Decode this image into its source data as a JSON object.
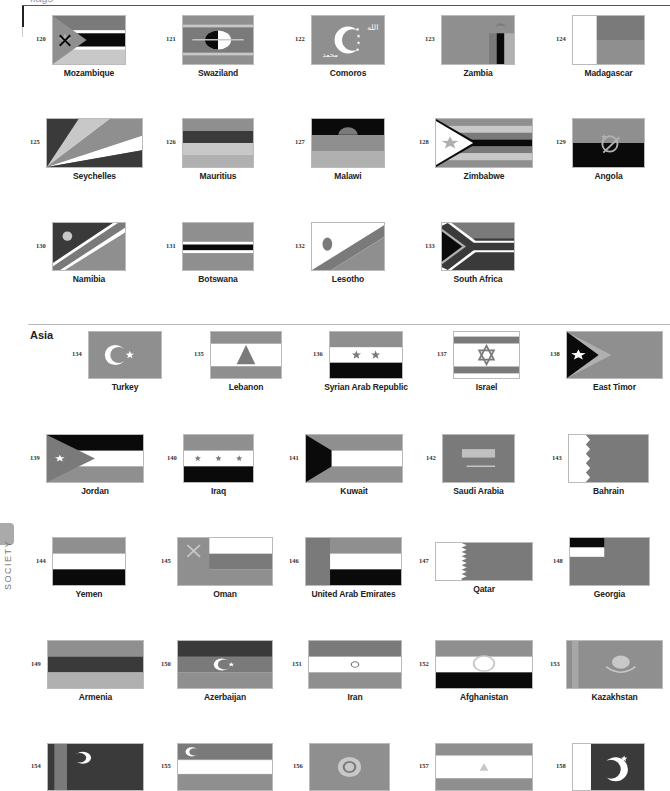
{
  "header": {
    "title": "flags"
  },
  "side_tab": {
    "label": "SOCIETY"
  },
  "sections": [
    {
      "label": "Asia",
      "x": 30,
      "y": 329
    }
  ],
  "colors": {
    "dark": "#3a3a3a",
    "mid": "#7a7a7a",
    "midlight": "#8f8f8f",
    "light": "#b0b0b0",
    "lighter": "#c8c8c8",
    "black": "#0a0a0a",
    "white": "#ffffff"
  },
  "flags": [
    {
      "num": "120",
      "name": "Mozambique",
      "x": 52,
      "y": 15,
      "w": 74,
      "h": 50,
      "kind": "mozambique"
    },
    {
      "num": "121",
      "name": "Swaziland",
      "x": 182,
      "y": 15,
      "w": 72,
      "h": 50,
      "kind": "swaziland"
    },
    {
      "num": "122",
      "name": "Comoros",
      "x": 311,
      "y": 15,
      "w": 74,
      "h": 50,
      "kind": "comoros"
    },
    {
      "num": "123",
      "name": "Zambia",
      "x": 441,
      "y": 15,
      "w": 74,
      "h": 50,
      "kind": "zambia"
    },
    {
      "num": "124",
      "name": "Madagascar",
      "x": 572,
      "y": 15,
      "w": 73,
      "h": 50,
      "kind": "madagascar"
    },
    {
      "num": "125",
      "name": "Seychelles",
      "x": 46,
      "y": 118,
      "w": 97,
      "h": 50,
      "kind": "seychelles"
    },
    {
      "num": "126",
      "name": "Mauritius",
      "x": 182,
      "y": 118,
      "w": 72,
      "h": 50,
      "kind": "mauritius"
    },
    {
      "num": "127",
      "name": "Malawi",
      "x": 311,
      "y": 118,
      "w": 74,
      "h": 50,
      "kind": "malawi"
    },
    {
      "num": "128",
      "name": "Zimbabwe",
      "x": 435,
      "y": 118,
      "w": 98,
      "h": 50,
      "kind": "zimbabwe"
    },
    {
      "num": "129",
      "name": "Angola",
      "x": 572,
      "y": 118,
      "w": 73,
      "h": 50,
      "kind": "angola"
    },
    {
      "num": "130",
      "name": "Namibia",
      "x": 52,
      "y": 222,
      "w": 74,
      "h": 49,
      "kind": "namibia"
    },
    {
      "num": "131",
      "name": "Botswana",
      "x": 182,
      "y": 222,
      "w": 72,
      "h": 49,
      "kind": "botswana"
    },
    {
      "num": "132",
      "name": "Lesotho",
      "x": 311,
      "y": 222,
      "w": 74,
      "h": 49,
      "kind": "lesotho"
    },
    {
      "num": "133",
      "name": "South Africa",
      "x": 441,
      "y": 222,
      "w": 74,
      "h": 49,
      "kind": "southafrica"
    },
    {
      "num": "134",
      "name": "Turkey",
      "x": 88,
      "y": 331,
      "w": 74,
      "h": 48,
      "kind": "turkey"
    },
    {
      "num": "135",
      "name": "Lebanon",
      "x": 210,
      "y": 331,
      "w": 72,
      "h": 48,
      "kind": "lebanon"
    },
    {
      "num": "136",
      "name": "Syrian Arab Republic",
      "x": 329,
      "y": 331,
      "w": 74,
      "h": 48,
      "kind": "syria"
    },
    {
      "num": "137",
      "name": "Israel",
      "x": 453,
      "y": 331,
      "w": 67,
      "h": 48,
      "kind": "israel"
    },
    {
      "num": "138",
      "name": "East Timor",
      "x": 566,
      "y": 331,
      "w": 97,
      "h": 48,
      "kind": "easttimor"
    },
    {
      "num": "139",
      "name": "Jordan",
      "x": 46,
      "y": 434,
      "w": 98,
      "h": 49,
      "kind": "jordan"
    },
    {
      "num": "140",
      "name": "Iraq",
      "x": 183,
      "y": 434,
      "w": 71,
      "h": 49,
      "kind": "iraq"
    },
    {
      "num": "141",
      "name": "Kuwait",
      "x": 305,
      "y": 434,
      "w": 98,
      "h": 49,
      "kind": "kuwait"
    },
    {
      "num": "142",
      "name": "Saudi Arabia",
      "x": 442,
      "y": 434,
      "w": 73,
      "h": 49,
      "kind": "saudi"
    },
    {
      "num": "143",
      "name": "Bahrain",
      "x": 568,
      "y": 434,
      "w": 81,
      "h": 49,
      "kind": "bahrain"
    },
    {
      "num": "144",
      "name": "Yemen",
      "x": 52,
      "y": 537,
      "w": 74,
      "h": 49,
      "kind": "yemen"
    },
    {
      "num": "145",
      "name": "Oman",
      "x": 177,
      "y": 537,
      "w": 96,
      "h": 49,
      "kind": "oman"
    },
    {
      "num": "146",
      "name": "United Arab Emirates",
      "x": 305,
      "y": 537,
      "w": 97,
      "h": 49,
      "kind": "uae"
    },
    {
      "num": "147",
      "name": "Qatar",
      "x": 435,
      "y": 542,
      "w": 98,
      "h": 39,
      "kind": "qatar"
    },
    {
      "num": "148",
      "name": "Georgia",
      "x": 569,
      "y": 537,
      "w": 81,
      "h": 49,
      "kind": "georgia"
    },
    {
      "num": "149",
      "name": "Armenia",
      "x": 47,
      "y": 640,
      "w": 97,
      "h": 49,
      "kind": "armenia"
    },
    {
      "num": "150",
      "name": "Azerbaijan",
      "x": 177,
      "y": 640,
      "w": 96,
      "h": 49,
      "kind": "azerbaijan"
    },
    {
      "num": "151",
      "name": "Iran",
      "x": 308,
      "y": 640,
      "w": 94,
      "h": 49,
      "kind": "iran"
    },
    {
      "num": "152",
      "name": "Afghanistan",
      "x": 435,
      "y": 640,
      "w": 98,
      "h": 49,
      "kind": "afghanistan"
    },
    {
      "num": "153",
      "name": "Kazakhstan",
      "x": 566,
      "y": 640,
      "w": 97,
      "h": 49,
      "kind": "kazakhstan"
    },
    {
      "num": "154",
      "name": "",
      "x": 47,
      "y": 743,
      "w": 97,
      "h": 48,
      "kind": "turkmenistan"
    },
    {
      "num": "155",
      "name": "",
      "x": 177,
      "y": 743,
      "w": 96,
      "h": 48,
      "kind": "uzbekistan"
    },
    {
      "num": "156",
      "name": "",
      "x": 309,
      "y": 743,
      "w": 81,
      "h": 48,
      "kind": "kyrgyzstan"
    },
    {
      "num": "157",
      "name": "",
      "x": 435,
      "y": 743,
      "w": 98,
      "h": 48,
      "kind": "tajikistan"
    },
    {
      "num": "158",
      "name": "",
      "x": 572,
      "y": 743,
      "w": 73,
      "h": 48,
      "kind": "pakistan"
    }
  ]
}
